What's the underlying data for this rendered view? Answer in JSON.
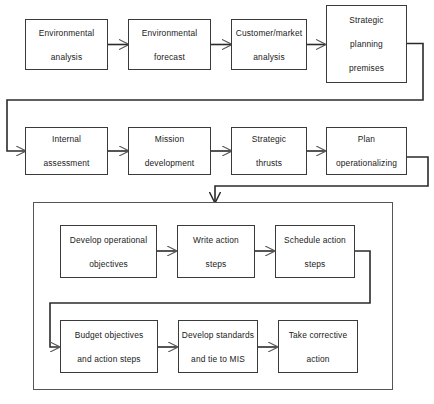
{
  "figure": {
    "caption": "",
    "colors": {
      "box_border": "#3a3a3a",
      "group_border": "#555555",
      "connector": "#2b2b2b",
      "background": "#ffffff",
      "text": "#1a1a1a"
    }
  },
  "rows": {
    "row1": {
      "name": "strategic-premises-row",
      "boxes": [
        {
          "id": "environmental-analysis",
          "line1": "Environmental",
          "line2": "analysis",
          "line3": ""
        },
        {
          "id": "environmental-forecast",
          "line1": "Environmental",
          "line2": "forecast",
          "line3": ""
        },
        {
          "id": "customer-market-analysis",
          "line1": "Customer/market",
          "line2": "analysis",
          "line3": ""
        },
        {
          "id": "strategic-planning-premises",
          "line1": "Strategic",
          "line2": "planning",
          "line3": "premises"
        }
      ]
    },
    "row2": {
      "name": "strategy-formulation-row",
      "boxes": [
        {
          "id": "internal-assessment",
          "line1": "Internal",
          "line2": "assessment",
          "line3": ""
        },
        {
          "id": "mission-development",
          "line1": "Mission",
          "line2": "development",
          "line3": ""
        },
        {
          "id": "strategic-thrusts",
          "line1": "Strategic",
          "line2": "thrusts",
          "line3": ""
        },
        {
          "id": "plan-operationalizing",
          "line1": "Plan",
          "line2": "operationalizing",
          "line3": ""
        }
      ]
    },
    "row3": {
      "name": "operational-planning-row",
      "boxes": [
        {
          "id": "develop-operational-objectives",
          "line1": "Develop operational",
          "line2": "objectives",
          "line3": ""
        },
        {
          "id": "write-action-steps",
          "line1": "Write action",
          "line2": "steps",
          "line3": ""
        },
        {
          "id": "schedule-action-steps",
          "line1": "Schedule action",
          "line2": "steps",
          "line3": ""
        }
      ]
    },
    "row4": {
      "name": "control-row",
      "boxes": [
        {
          "id": "budget-objectives-and-action-steps",
          "line1": "Budget objectives",
          "line2": "and action steps",
          "line3": ""
        },
        {
          "id": "develop-standards-and-tie-to-mis",
          "line1": "Develop standards",
          "line2": "and tie to MIS",
          "line3": ""
        },
        {
          "id": "take-corrective-action",
          "line1": "Take  corrective",
          "line2": "action",
          "line3": ""
        }
      ]
    }
  },
  "group_frame": {
    "name": "operational-implementation-group",
    "label": ""
  },
  "connectors": [
    {
      "from": "environmental-analysis",
      "to": "environmental-forecast",
      "style": "arrow-right"
    },
    {
      "from": "environmental-forecast",
      "to": "customer-market-analysis",
      "style": "arrow-right"
    },
    {
      "from": "customer-market-analysis",
      "to": "strategic-planning-premises",
      "style": "arrow-right"
    },
    {
      "from": "strategic-planning-premises",
      "to": "internal-assessment",
      "style": "wrap-right-down-left-arrow"
    },
    {
      "from": "internal-assessment",
      "to": "mission-development",
      "style": "arrow-right"
    },
    {
      "from": "mission-development",
      "to": "strategic-thrusts",
      "style": "arrow-right"
    },
    {
      "from": "strategic-thrusts",
      "to": "plan-operationalizing",
      "style": "arrow-right"
    },
    {
      "from": "plan-operationalizing",
      "to": "operational-implementation-group",
      "style": "wrap-right-down-left-arrow-down"
    },
    {
      "from": "develop-operational-objectives",
      "to": "write-action-steps",
      "style": "arrow-right"
    },
    {
      "from": "write-action-steps",
      "to": "schedule-action-steps",
      "style": "arrow-right"
    },
    {
      "from": "schedule-action-steps",
      "to": "budget-objectives-and-action-steps",
      "style": "wrap-right-down-left-arrow"
    },
    {
      "from": "budget-objectives-and-action-steps",
      "to": "develop-standards-and-tie-to-mis",
      "style": "arrow-right"
    },
    {
      "from": "develop-standards-and-tie-to-mis",
      "to": "take-corrective-action",
      "style": "arrow-right"
    }
  ]
}
